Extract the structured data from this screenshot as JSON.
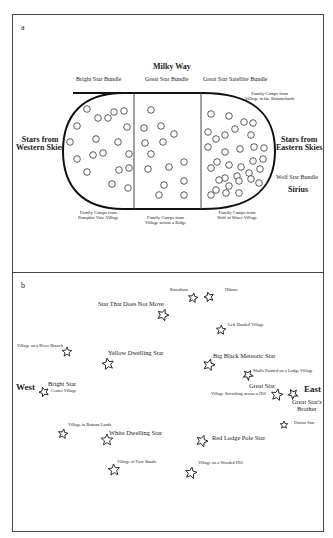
{
  "figure": {
    "panel_a": {
      "label": "a",
      "title": "Milky Way",
      "bundles": [
        "Bright Star Bundle",
        "Great Star Bundle",
        "Great Star Satellite Bundle"
      ],
      "west_label": [
        "Stars from",
        "Western Skies"
      ],
      "east_label": [
        "Stars from",
        "Eastern Skies"
      ],
      "top_right_note": [
        "Family Camps from",
        "Village in the Bottomlands"
      ],
      "wolf_star_bundle": "Wolf Star Bundle",
      "sirius": "Sirius",
      "bottom_notes": [
        [
          "Family Camps from",
          "Pumpkin Vine Village"
        ],
        [
          "Family Camps from",
          "Village across a Ridge"
        ],
        [
          "Family Camps from",
          "Wolf in Water Village"
        ]
      ],
      "section_star_counts": [
        19,
        14,
        36
      ]
    },
    "panel_b": {
      "label": "b",
      "west": "West",
      "east": "East",
      "stars": [
        {
          "name": "Kawaharu",
          "size": "sm"
        },
        {
          "name": "Hikuru",
          "size": "sm"
        },
        {
          "name": "Star That Does Not Move",
          "size": "lg"
        },
        {
          "name": "Left Handed Village",
          "size": "sm"
        },
        {
          "name": "Village on a River Branch",
          "size": "sm"
        },
        {
          "name": "Yellow Dwelling Star",
          "size": "lg"
        },
        {
          "name": "Big Black Meteoric Star",
          "size": "lg"
        },
        {
          "name": "Skulls Painted on a Lodge Village",
          "size": "sm"
        },
        {
          "name": "Bright Star",
          "size": "lg"
        },
        {
          "name": "Center Village",
          "size": "sm"
        },
        {
          "name": "Great Star",
          "size": "lg"
        },
        {
          "name": "Village Stretching across a Hill",
          "size": "sm"
        },
        {
          "name": "Great Star's",
          "size": "lg"
        },
        {
          "name": "Brother",
          "size": "lg"
        },
        {
          "name": "Doctor Star",
          "size": "sm"
        },
        {
          "name": "Village in Bottom Lands",
          "size": "sm"
        },
        {
          "name": "White Dwelling Star",
          "size": "lg"
        },
        {
          "name": "Red Lodge Pole Star",
          "size": "lg"
        },
        {
          "name": "Village of Four Bands",
          "size": "sm"
        },
        {
          "name": "Village on a Wooded Hill",
          "size": "sm"
        }
      ]
    }
  }
}
